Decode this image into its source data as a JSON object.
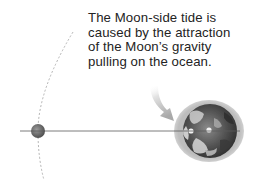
{
  "caption": {
    "lines": [
      "The Moon-side tide is",
      "caused by the attraction",
      "of the Moon’s gravity",
      "pulling on the ocean."
    ]
  },
  "diagram": {
    "bodies": [
      {
        "name": "Moon",
        "shape": "circle",
        "cx": 38,
        "cy": 131,
        "r": 7
      },
      {
        "name": "Earth",
        "shape": "ellipse-with-tidal-bulge",
        "cx": 209,
        "cy": 131,
        "rx": 35,
        "ry": 32
      }
    ],
    "orbit_path": "dashed arc (Moon's orbit)",
    "axis_line": "horizontal line through Moon and Earth centers",
    "arrow": "curved pointer from caption to Moon-side tidal bulge"
  },
  "colors": {
    "text": "#232323",
    "orbit": "#aaaaaa",
    "axis": "#555555",
    "bulge": "#c8c8c8",
    "arrow": "#bdbdbd",
    "earth_dark": "#3a3a3a",
    "moon": "#6e6e6e"
  }
}
